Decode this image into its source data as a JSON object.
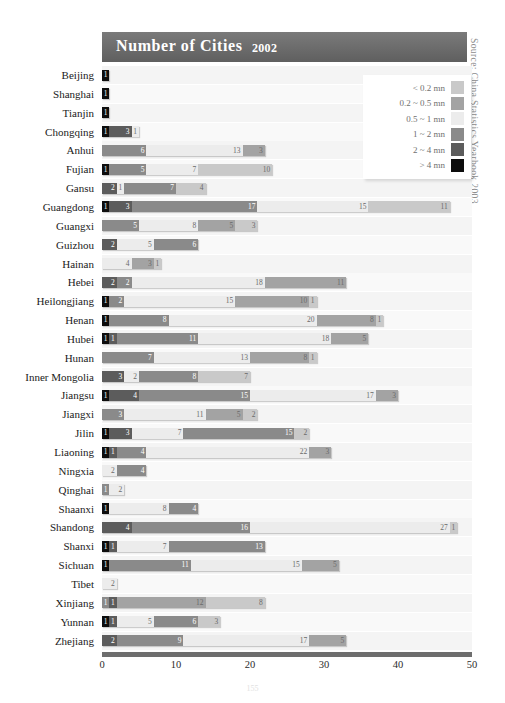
{
  "banner": {
    "title": "Number of Cities",
    "year": "2002"
  },
  "source": "Source: China Statistics Yearbook 2003",
  "page_number": "155",
  "legend": {
    "items": [
      {
        "label": "< 0.2 mn",
        "color": "#c9c9c9"
      },
      {
        "label": "0.2 ~ 0.5 mn",
        "color": "#a3a3a3"
      },
      {
        "label": "0.5 ~ 1 mn",
        "color": "#ececec"
      },
      {
        "label": "1 ~ 2 mn",
        "color": "#8a8a8a"
      },
      {
        "label": "2 ~ 4 mn",
        "color": "#5c5c5c"
      },
      {
        "label": "> 4 mn",
        "color": "#0d0d0d"
      }
    ]
  },
  "chart_data": {
    "type": "bar",
    "orientation": "horizontal",
    "stacked": true,
    "title": "Number of Cities 2002",
    "xlabel": "",
    "ylabel": "",
    "xlim": [
      0,
      50
    ],
    "xticks": [
      0,
      10,
      20,
      30,
      40,
      50
    ],
    "grid": false,
    "legend_position": "top-right",
    "series": [
      {
        "name": "< 0.2 mn",
        "color": "#c9c9c9"
      },
      {
        "name": "0.2 ~ 0.5 mn",
        "color": "#a3a3a3"
      },
      {
        "name": "0.5 ~ 1 mn",
        "color": "#ececec"
      },
      {
        "name": "1 ~ 2 mn",
        "color": "#8a8a8a"
      },
      {
        "name": "2 ~ 4 mn",
        "color": "#5c5c5c"
      },
      {
        "name": "> 4 mn",
        "color": "#0d0d0d"
      }
    ],
    "categories": [
      "Beijing",
      "Shanghai",
      "Tianjin",
      "Chongqing",
      "Anhui",
      "Fujian",
      "Gansu",
      "Guangdong",
      "Guangxi",
      "Guizhou",
      "Hainan",
      "Hebei",
      "Heilongjiang",
      "Henan",
      "Hubei",
      "Hunan",
      "Inner Mongolia",
      "Jiangsu",
      "Jiangxi",
      "Jilin",
      "Liaoning",
      "Ningxia",
      "Qinghai",
      "Shaanxi",
      "Shandong",
      "Shanxi",
      "Sichuan",
      "Tibet",
      "Xinjiang",
      "Yunnan",
      "Zhejiang"
    ],
    "rows": [
      {
        "category": "Beijing",
        "segments": [
          {
            "class": "> 4 mn",
            "value": 1
          }
        ]
      },
      {
        "category": "Shanghai",
        "segments": [
          {
            "class": "> 4 mn",
            "value": 1
          }
        ]
      },
      {
        "category": "Tianjin",
        "segments": [
          {
            "class": "> 4 mn",
            "value": 1
          }
        ]
      },
      {
        "category": "Chongqing",
        "segments": [
          {
            "class": "> 4 mn",
            "value": 1
          },
          {
            "class": "2 ~ 4 mn",
            "value": 3
          },
          {
            "class": "0.5 ~ 1 mn",
            "value": 1
          }
        ]
      },
      {
        "category": "Anhui",
        "segments": [
          {
            "class": "1 ~ 2 mn",
            "value": 6
          },
          {
            "class": "0.5 ~ 1 mn",
            "value": 13
          },
          {
            "class": "0.2 ~ 0.5 mn",
            "value": 3
          }
        ]
      },
      {
        "category": "Fujian",
        "segments": [
          {
            "class": "> 4 mn",
            "value": 1
          },
          {
            "class": "1 ~ 2 mn",
            "value": 5
          },
          {
            "class": "0.5 ~ 1 mn",
            "value": 7
          },
          {
            "class": "< 0.2 mn",
            "value": 10
          }
        ]
      },
      {
        "category": "Gansu",
        "segments": [
          {
            "class": "2 ~ 4 mn",
            "value": 2
          },
          {
            "class": "0.5 ~ 1 mn",
            "value": 1
          },
          {
            "class": "1 ~ 2 mn",
            "value": 7
          },
          {
            "class": "< 0.2 mn",
            "value": 4
          }
        ]
      },
      {
        "category": "Guangdong",
        "segments": [
          {
            "class": "> 4 mn",
            "value": 1
          },
          {
            "class": "2 ~ 4 mn",
            "value": 3
          },
          {
            "class": "1 ~ 2 mn",
            "value": 17
          },
          {
            "class": "0.5 ~ 1 mn",
            "value": 15
          },
          {
            "class": "< 0.2 mn",
            "value": 11
          }
        ]
      },
      {
        "category": "Guangxi",
        "segments": [
          {
            "class": "1 ~ 2 mn",
            "value": 5
          },
          {
            "class": "0.5 ~ 1 mn",
            "value": 8
          },
          {
            "class": "0.2 ~ 0.5 mn",
            "value": 5
          },
          {
            "class": "< 0.2 mn",
            "value": 3
          }
        ]
      },
      {
        "category": "Guizhou",
        "segments": [
          {
            "class": "2 ~ 4 mn",
            "value": 2
          },
          {
            "class": "0.5 ~ 1 mn",
            "value": 5
          },
          {
            "class": "1 ~ 2 mn",
            "value": 6
          }
        ]
      },
      {
        "category": "Hainan",
        "segments": [
          {
            "class": "0.5 ~ 1 mn",
            "value": 4
          },
          {
            "class": "0.2 ~ 0.5 mn",
            "value": 3
          },
          {
            "class": "< 0.2 mn",
            "value": 1
          }
        ]
      },
      {
        "category": "Hebei",
        "segments": [
          {
            "class": "2 ~ 4 mn",
            "value": 2
          },
          {
            "class": "1 ~ 2 mn",
            "value": 2
          },
          {
            "class": "0.5 ~ 1 mn",
            "value": 18
          },
          {
            "class": "0.2 ~ 0.5 mn",
            "value": 11
          }
        ]
      },
      {
        "category": "Heilongjiang",
        "segments": [
          {
            "class": "> 4 mn",
            "value": 1
          },
          {
            "class": "1 ~ 2 mn",
            "value": 2
          },
          {
            "class": "0.5 ~ 1 mn",
            "value": 15
          },
          {
            "class": "0.2 ~ 0.5 mn",
            "value": 10
          },
          {
            "class": "< 0.2 mn",
            "value": 1
          }
        ]
      },
      {
        "category": "Henan",
        "segments": [
          {
            "class": "> 4 mn",
            "value": 1
          },
          {
            "class": "1 ~ 2 mn",
            "value": 8
          },
          {
            "class": "0.5 ~ 1 mn",
            "value": 20
          },
          {
            "class": "0.2 ~ 0.5 mn",
            "value": 8
          },
          {
            "class": "< 0.2 mn",
            "value": 1
          }
        ]
      },
      {
        "category": "Hubei",
        "segments": [
          {
            "class": "> 4 mn",
            "value": 1
          },
          {
            "class": "2 ~ 4 mn",
            "value": 1
          },
          {
            "class": "1 ~ 2 mn",
            "value": 11
          },
          {
            "class": "0.5 ~ 1 mn",
            "value": 18
          },
          {
            "class": "0.2 ~ 0.5 mn",
            "value": 5
          }
        ]
      },
      {
        "category": "Hunan",
        "segments": [
          {
            "class": "1 ~ 2 mn",
            "value": 7
          },
          {
            "class": "0.5 ~ 1 mn",
            "value": 13
          },
          {
            "class": "0.2 ~ 0.5 mn",
            "value": 8
          },
          {
            "class": "< 0.2 mn",
            "value": 1
          }
        ]
      },
      {
        "category": "Inner Mongolia",
        "segments": [
          {
            "class": "2 ~ 4 mn",
            "value": 3
          },
          {
            "class": "0.5 ~ 1 mn",
            "value": 2
          },
          {
            "class": "1 ~ 2 mn",
            "value": 8
          },
          {
            "class": "< 0.2 mn",
            "value": 7
          }
        ]
      },
      {
        "category": "Jiangsu",
        "segments": [
          {
            "class": "> 4 mn",
            "value": 1
          },
          {
            "class": "2 ~ 4 mn",
            "value": 4
          },
          {
            "class": "1 ~ 2 mn",
            "value": 15
          },
          {
            "class": "0.5 ~ 1 mn",
            "value": 17
          },
          {
            "class": "0.2 ~ 0.5 mn",
            "value": 3
          }
        ]
      },
      {
        "category": "Jiangxi",
        "segments": [
          {
            "class": "1 ~ 2 mn",
            "value": 3
          },
          {
            "class": "0.5 ~ 1 mn",
            "value": 11
          },
          {
            "class": "0.2 ~ 0.5 mn",
            "value": 5
          },
          {
            "class": "< 0.2 mn",
            "value": 2
          }
        ]
      },
      {
        "category": "Jilin",
        "segments": [
          {
            "class": "> 4 mn",
            "value": 1
          },
          {
            "class": "2 ~ 4 mn",
            "value": 3
          },
          {
            "class": "0.5 ~ 1 mn",
            "value": 7
          },
          {
            "class": "1 ~ 2 mn",
            "value": 15
          },
          {
            "class": "< 0.2 mn",
            "value": 2
          }
        ]
      },
      {
        "category": "Liaoning",
        "segments": [
          {
            "class": "> 4 mn",
            "value": 1
          },
          {
            "class": "2 ~ 4 mn",
            "value": 1
          },
          {
            "class": "1 ~ 2 mn",
            "value": 4
          },
          {
            "class": "0.5 ~ 1 mn",
            "value": 22
          },
          {
            "class": "0.2 ~ 0.5 mn",
            "value": 3
          }
        ]
      },
      {
        "category": "Ningxia",
        "segments": [
          {
            "class": "0.5 ~ 1 mn",
            "value": 2
          },
          {
            "class": "1 ~ 2 mn",
            "value": 4
          }
        ]
      },
      {
        "category": "Qinghai",
        "segments": [
          {
            "class": "1 ~ 2 mn",
            "value": 1
          },
          {
            "class": "0.5 ~ 1 mn",
            "value": 2
          }
        ]
      },
      {
        "category": "Shaanxi",
        "segments": [
          {
            "class": "> 4 mn",
            "value": 1
          },
          {
            "class": "0.5 ~ 1 mn",
            "value": 8
          },
          {
            "class": "1 ~ 2 mn",
            "value": 4
          }
        ]
      },
      {
        "category": "Shandong",
        "segments": [
          {
            "class": "2 ~ 4 mn",
            "value": 4
          },
          {
            "class": "1 ~ 2 mn",
            "value": 16
          },
          {
            "class": "0.5 ~ 1 mn",
            "value": 27
          },
          {
            "class": "< 0.2 mn",
            "value": 1
          }
        ]
      },
      {
        "category": "Shanxi",
        "segments": [
          {
            "class": "> 4 mn",
            "value": 1
          },
          {
            "class": "2 ~ 4 mn",
            "value": 1
          },
          {
            "class": "0.5 ~ 1 mn",
            "value": 7
          },
          {
            "class": "1 ~ 2 mn",
            "value": 13
          }
        ]
      },
      {
        "category": "Sichuan",
        "segments": [
          {
            "class": "> 4 mn",
            "value": 1
          },
          {
            "class": "1 ~ 2 mn",
            "value": 11
          },
          {
            "class": "0.5 ~ 1 mn",
            "value": 15
          },
          {
            "class": "0.2 ~ 0.5 mn",
            "value": 5
          }
        ]
      },
      {
        "category": "Tibet",
        "segments": [
          {
            "class": "0.5 ~ 1 mn",
            "value": 2
          }
        ]
      },
      {
        "category": "Xinjiang",
        "segments": [
          {
            "class": "1 ~ 2 mn",
            "value": 1
          },
          {
            "class": "2 ~ 4 mn",
            "value": 1
          },
          {
            "class": "0.2 ~ 0.5 mn",
            "value": 12
          },
          {
            "class": "< 0.2 mn",
            "value": 8
          }
        ]
      },
      {
        "category": "Yunnan",
        "segments": [
          {
            "class": "> 4 mn",
            "value": 1
          },
          {
            "class": "2 ~ 4 mn",
            "value": 1
          },
          {
            "class": "0.5 ~ 1 mn",
            "value": 5
          },
          {
            "class": "1 ~ 2 mn",
            "value": 6
          },
          {
            "class": "< 0.2 mn",
            "value": 3
          }
        ]
      },
      {
        "category": "Zhejiang",
        "segments": [
          {
            "class": "2 ~ 4 mn",
            "value": 2
          },
          {
            "class": "1 ~ 2 mn",
            "value": 9
          },
          {
            "class": "0.5 ~ 1 mn",
            "value": 17
          },
          {
            "class": "0.2 ~ 0.5 mn",
            "value": 5
          }
        ]
      }
    ]
  }
}
